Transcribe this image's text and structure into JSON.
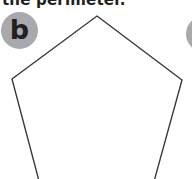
{
  "instruction": {
    "text": "the perimeter."
  },
  "exercise": {
    "label": "b",
    "shape": "regular pentagon",
    "badge_color": "#a7a9ac",
    "line_color": "#3a3a3a",
    "vertices": [
      [
        97,
        16
      ],
      [
        182,
        80
      ],
      [
        150,
        196
      ],
      [
        43,
        196
      ],
      [
        12,
        79
      ]
    ]
  },
  "next_exercise_badge": {
    "label": "",
    "partially_visible": true
  }
}
